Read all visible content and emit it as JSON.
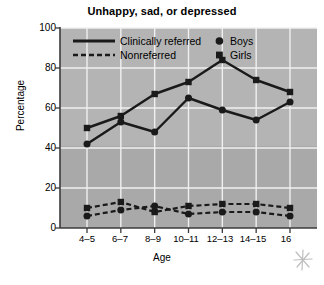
{
  "chart_data": {
    "type": "line",
    "title": "Unhappy, sad, or depressed",
    "xlabel": "Age",
    "ylabel": "Percentage",
    "categories": [
      "4–5",
      "6–7",
      "8–9",
      "10–11",
      "12–13",
      "14–15",
      "16"
    ],
    "ylim": [
      0,
      100
    ],
    "yticks": [
      0,
      20,
      40,
      60,
      80,
      100
    ],
    "ytick_labels": [
      "0",
      "20",
      "40",
      "60",
      "80",
      "100"
    ],
    "grid": true,
    "legend_position": "top-inside",
    "series": [
      {
        "name": "Clinically referred — Girls",
        "group": "Clinically referred",
        "gender": "Girls",
        "style": "solid",
        "marker": "square",
        "values": [
          50,
          56,
          67,
          73,
          84,
          74,
          68
        ]
      },
      {
        "name": "Clinically referred — Boys",
        "group": "Clinically referred",
        "gender": "Boys",
        "style": "solid",
        "marker": "circle",
        "values": [
          42,
          53,
          48,
          65,
          59,
          54,
          63
        ]
      },
      {
        "name": "Nonreferred — Girls",
        "group": "Nonreferred",
        "gender": "Girls",
        "style": "dashed",
        "marker": "square",
        "values": [
          10,
          13,
          8,
          11,
          12,
          12,
          10
        ]
      },
      {
        "name": "Nonreferred — Boys",
        "group": "Nonreferred",
        "gender": "Boys",
        "style": "dashed",
        "marker": "circle",
        "values": [
          6,
          9,
          11,
          7,
          8,
          8,
          6
        ]
      }
    ],
    "legend": [
      {
        "label": "Clinically referred",
        "type": "line",
        "style": "solid"
      },
      {
        "label": "Nonreferred",
        "type": "line",
        "style": "dashed"
      },
      {
        "label": "Boys",
        "type": "marker",
        "marker": "circle"
      },
      {
        "label": "Girls",
        "type": "marker",
        "marker": "square"
      }
    ],
    "colors": {
      "plot_background": "#b4b4b4",
      "plot_background_lower": "#a8a8a8",
      "series_line": "#1a1a1a",
      "gridline": "#f0f0f0",
      "axis": "#3b3b3b",
      "page_background": "#ffffff",
      "text": "#000000"
    },
    "annotation": {
      "name": "asterisk-scribble",
      "symbol": "✳"
    }
  }
}
